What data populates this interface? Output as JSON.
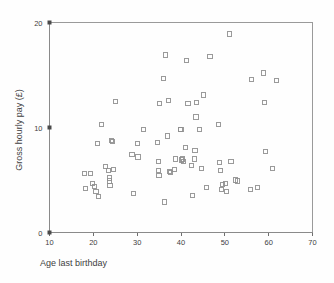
{
  "chart_data": {
    "type": "scatter",
    "title": "",
    "xlabel": "Age last birthday",
    "ylabel": "Gross hourly pay (£)",
    "xlim": [
      10,
      70
    ],
    "ylim": [
      0,
      20
    ],
    "xticks": [
      10,
      20,
      30,
      40,
      50,
      60,
      70
    ],
    "yticks": [
      0,
      10,
      20
    ],
    "xtick_labels": [
      "10",
      "20",
      "30",
      "40",
      "50",
      "60",
      "70"
    ],
    "ytick_labels": [
      "0",
      "10",
      "20"
    ],
    "grid": false,
    "legend": null,
    "marker": "open-square",
    "marker_color": "#8f8f8f",
    "points": [
      [
        18.0,
        5.6
      ],
      [
        18.2,
        4.2
      ],
      [
        19.4,
        5.6
      ],
      [
        19.8,
        4.7
      ],
      [
        20.2,
        4.4
      ],
      [
        20.6,
        3.9
      ],
      [
        21.0,
        8.5
      ],
      [
        21.2,
        3.4
      ],
      [
        21.8,
        10.3
      ],
      [
        22.8,
        6.3
      ],
      [
        23.4,
        5.9
      ],
      [
        23.6,
        4.9
      ],
      [
        23.7,
        5.2
      ],
      [
        23.8,
        4.5
      ],
      [
        24.2,
        8.8
      ],
      [
        24.4,
        8.7
      ],
      [
        24.6,
        6.0
      ],
      [
        25.0,
        12.5
      ],
      [
        28.8,
        7.4
      ],
      [
        29.2,
        3.7
      ],
      [
        30.0,
        8.5
      ],
      [
        30.2,
        7.2
      ],
      [
        31.4,
        9.8
      ],
      [
        34.6,
        8.6
      ],
      [
        34.8,
        6.8
      ],
      [
        34.9,
        5.9
      ],
      [
        35.0,
        5.4
      ],
      [
        35.1,
        12.3
      ],
      [
        36.0,
        14.7
      ],
      [
        36.2,
        2.9
      ],
      [
        36.4,
        16.9
      ],
      [
        37.0,
        9.2
      ],
      [
        37.2,
        12.6
      ],
      [
        37.4,
        5.8
      ],
      [
        37.6,
        5.7
      ],
      [
        38.6,
        6.0
      ],
      [
        38.8,
        7.0
      ],
      [
        39.8,
        9.8
      ],
      [
        40.0,
        9.8
      ],
      [
        40.2,
        6.9
      ],
      [
        40.4,
        7.0
      ],
      [
        40.5,
        6.8
      ],
      [
        41.0,
        8.1
      ],
      [
        41.2,
        16.4
      ],
      [
        41.6,
        12.3
      ],
      [
        42.4,
        6.4
      ],
      [
        42.6,
        3.5
      ],
      [
        43.0,
        7.0
      ],
      [
        43.2,
        7.8
      ],
      [
        43.4,
        11.0
      ],
      [
        43.6,
        12.4
      ],
      [
        44.2,
        9.8
      ],
      [
        44.6,
        6.1
      ],
      [
        45.2,
        13.1
      ],
      [
        45.8,
        4.3
      ],
      [
        46.6,
        16.8
      ],
      [
        48.6,
        10.3
      ],
      [
        48.8,
        6.7
      ],
      [
        49.0,
        5.9
      ],
      [
        49.2,
        4.1
      ],
      [
        49.4,
        4.6
      ],
      [
        50.2,
        4.7
      ],
      [
        50.4,
        3.9
      ],
      [
        51.0,
        18.9
      ],
      [
        51.4,
        6.8
      ],
      [
        52.4,
        5.0
      ],
      [
        52.8,
        4.9
      ],
      [
        55.8,
        4.1
      ],
      [
        56.0,
        14.6
      ],
      [
        57.4,
        4.3
      ],
      [
        58.8,
        15.2
      ],
      [
        59.0,
        12.4
      ],
      [
        59.2,
        7.7
      ],
      [
        60.8,
        6.1
      ],
      [
        61.8,
        14.5
      ]
    ]
  }
}
